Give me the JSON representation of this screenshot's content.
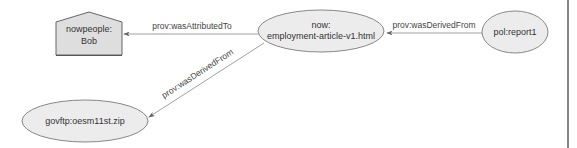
{
  "diagram": {
    "type": "provenance-graph",
    "colors": {
      "node_fill": "#e8e8e8",
      "node_stroke": "#888888",
      "agent_fill": "#dedede",
      "agent_stroke": "#666666",
      "edge": "#888888",
      "border": "#333333"
    },
    "nodes": [
      {
        "id": "bob",
        "shape": "house",
        "line1": "nowpeople:",
        "line2": "Bob"
      },
      {
        "id": "article",
        "shape": "ellipse",
        "line1": "now:",
        "line2": "employment-article-v1.html"
      },
      {
        "id": "report",
        "shape": "ellipse",
        "line1": "pol:report1"
      },
      {
        "id": "zip",
        "shape": "ellipse",
        "line1": "govftp:oesm11st.zip"
      }
    ],
    "edges": [
      {
        "from": "article",
        "to": "bob",
        "label": "prov:wasAttributedTo"
      },
      {
        "from": "report",
        "to": "article",
        "label": "prov:wasDerivedFrom"
      },
      {
        "from": "article",
        "to": "zip",
        "label": "prov:wasDerivedFrom"
      }
    ]
  }
}
